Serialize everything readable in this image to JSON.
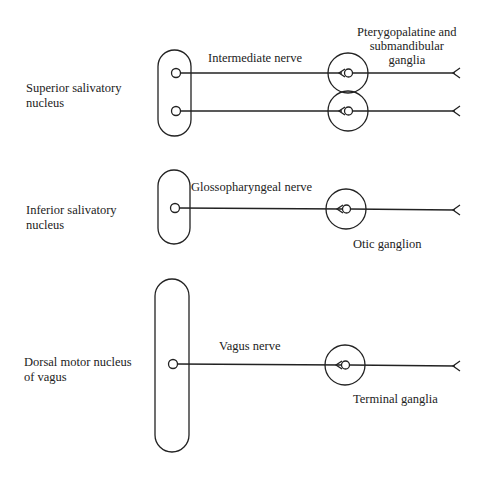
{
  "nuclei": [
    {
      "label": "Superior salivatory\nnucleus"
    },
    {
      "label": "Inferior salivatory\nnucleus"
    },
    {
      "label": "Dorsal motor nucleus\nof vagus"
    }
  ],
  "nerves": [
    {
      "label": "Intermediate nerve"
    },
    {
      "label": "Glossopharyngeal nerve"
    },
    {
      "label": "Vagus nerve"
    }
  ],
  "ganglia": [
    {
      "label": "Pterygopalatine and\nsubmandibular\nganglia"
    },
    {
      "label": "Otic ganglion"
    },
    {
      "label": "Terminal ganglia"
    }
  ],
  "colors": {
    "stroke": "#222222",
    "background": "#ffffff"
  }
}
